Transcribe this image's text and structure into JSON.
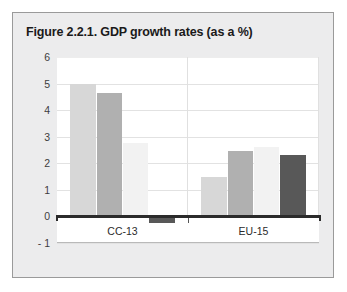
{
  "figure": {
    "title": "Figure 2.2.1. GDP growth rates (as a %)",
    "panel_background": "#ececed",
    "panel_border": "#9a9a9a",
    "plot_background": "#ffffff"
  },
  "chart_data": {
    "type": "bar",
    "title": "Figure 2.2.1. GDP growth rates (as a %)",
    "xlabel": "",
    "ylabel": "",
    "ylim": [
      -1,
      6
    ],
    "yticks": [
      6,
      5,
      4,
      3,
      2,
      1,
      0,
      -1
    ],
    "ytick_labels": [
      "6",
      "5",
      "4",
      "3",
      "2",
      "1",
      "0",
      "- 1"
    ],
    "grid": true,
    "legend": "none",
    "categories": [
      "CC-13",
      "EU-15"
    ],
    "series": [
      {
        "name": "series-1",
        "color": "#d7d7d7",
        "values": [
          5.0,
          1.5
        ]
      },
      {
        "name": "series-2",
        "color": "#b0b0b0",
        "values": [
          4.65,
          2.45
        ]
      },
      {
        "name": "series-3",
        "color": "#f2f2f2",
        "values": [
          2.75,
          2.6
        ]
      },
      {
        "name": "series-4",
        "color": "#585858",
        "values": [
          -0.25,
          2.3
        ]
      }
    ]
  }
}
